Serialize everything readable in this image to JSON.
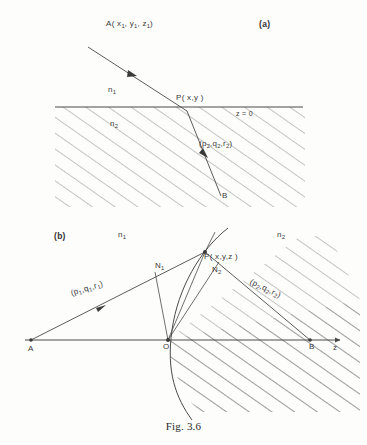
{
  "figure": {
    "caption": "Fig. 3.6",
    "panel_a_label": "(a)",
    "panel_b_label": "(b)"
  },
  "panel_a": {
    "source_point": "A( x",
    "source_sub1": "1",
    "source_mid1": ", y",
    "source_sub2": "1",
    "source_mid2": ", z",
    "source_sub3": "1",
    "source_end": ")",
    "source_full": "A( x1, y1, z1)",
    "medium_upper": "n",
    "medium_upper_sub": "1",
    "medium_lower": "n",
    "medium_lower_sub": "2",
    "interface_point": "P( x,y )",
    "interface_plane": "z = 0",
    "direction_cosines": "(p",
    "direction_sub1": "2",
    "direction_mid1": ",q",
    "direction_sub2": "2",
    "direction_mid2": ",r",
    "direction_sub3": "2",
    "direction_end": ")",
    "end_point": "B"
  },
  "panel_b": {
    "medium_left": "n",
    "medium_left_sub": "1",
    "medium_right": "n",
    "medium_right_sub": "2",
    "point_a": "A",
    "point_o": "O",
    "point_b": "B",
    "axis_label": "z",
    "normal_1": "N",
    "normal_1_sub": "1",
    "normal_2": "N",
    "normal_2_sub": "2",
    "interface_point": "P( x,y,z )",
    "incident_cosines": "(p",
    "incident_sub1": "1",
    "incident_mid1": ",q",
    "incident_sub2": "1",
    "incident_mid2": ",r",
    "incident_sub3": "1",
    "incident_end": ")",
    "refracted_cosines": "(p",
    "refracted_sub1": "2",
    "refracted_mid1": ",q",
    "refracted_sub2": "2",
    "refracted_mid2": ",r",
    "refracted_sub3": "2",
    "refracted_end": ")"
  },
  "colors": {
    "line": "#4a4a4a",
    "hatch": "#6d6d6d",
    "text": "#3a3a3a",
    "background": "#fdfdfc"
  }
}
